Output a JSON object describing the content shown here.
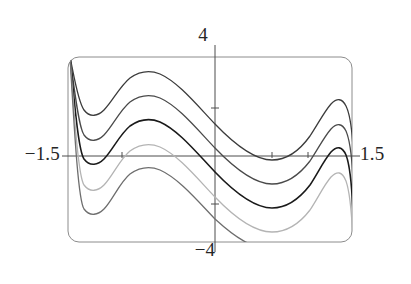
{
  "figure": {
    "title": "",
    "background": "#ffffff",
    "frame": {
      "x": 68,
      "y": 57,
      "width": 284,
      "height": 185,
      "corner_radius": 11,
      "stroke": "#8c8c8c",
      "stroke_width": 1
    },
    "axes": {
      "horizontal": {
        "y": 156,
        "x1": 62,
        "x2": 360,
        "stroke": "#4d4d4d"
      },
      "vertical": {
        "x": 215,
        "y1": 45,
        "y2": 252,
        "stroke": "#4d4d4d"
      },
      "ticks_h": [
        122,
        272,
        308
      ],
      "ticks_v": [
        108,
        204
      ],
      "tick_len": 5
    },
    "labels": {
      "top": "4",
      "bottom": "−4",
      "left": "−1.5",
      "right": "1.5"
    }
  },
  "chart_data": {
    "type": "line",
    "title": "",
    "xlabel": "",
    "ylabel": "",
    "xlim": [
      -1.5,
      1.5
    ],
    "ylim": [
      -4,
      4
    ],
    "xticks": [
      -1.5,
      1.5
    ],
    "yticks": [
      -4,
      4
    ],
    "grid": false,
    "legend": null,
    "series": [
      {
        "name": "curve-1",
        "color": "#3c3c3c",
        "width": 1.3,
        "offset": 2.0,
        "path": "M 70,57 C 74,76 78,102 84,110 C 90,118 98,116 104,110 C 112,102 120,86 130,78 C 140,71 150,70 160,74 C 178,82 196,104 215,124 C 238,148 256,160 272,160 C 288,160 300,150 310,136 C 318,124 324,112 331,104 C 337,98 342,98 346,106 C 350,114 352,130 353,148"
      },
      {
        "name": "curve-2",
        "color": "#4a4a4a",
        "width": 1.3,
        "offset": 1.0,
        "path": "M 70,57 C 74,84 78,126 84,135 C 90,143 98,141 104,135 C 112,127 120,110 130,102 C 140,95 150,94 160,98 C 178,106 196,128 215,148 C 238,172 256,184 272,184 C 288,184 300,174 310,161 C 318,149 324,137 331,129 C 337,123 342,123 346,131 C 350,140 352,158 353,180"
      },
      {
        "name": "curve-3",
        "color": "#1a1a1a",
        "width": 1.6,
        "offset": 0.0,
        "path": "M 70,57 C 74,96 78,150 84,159 C 90,167 98,165 104,159 C 112,151 120,134 130,126 C 140,119 150,118 160,122 C 178,130 196,152 215,172 C 238,196 256,208 272,208 C 288,208 300,198 310,185 C 318,173 324,160 331,152 C 337,146 342,146 346,155 C 350,165 352,188 353,214"
      },
      {
        "name": "curve-4",
        "color": "#b4b4b4",
        "width": 1.3,
        "offset": -1.0,
        "path": "M 70,57 C 74,110 78,176 84,185 C 90,193 98,191 104,185 C 112,177 120,159 130,151 C 140,144 150,143 160,147 C 178,155 196,177 215,197 C 238,221 256,232 272,232 C 288,232 300,223 310,210 C 318,198 324,185 331,177 C 337,171 342,171 346,181 C 350,192 352,218 353,242"
      },
      {
        "name": "curve-5",
        "color": "#6e6e6e",
        "width": 1.3,
        "offset": -2.0,
        "path": "M 70,57 C 74,124 78,200 84,209 C 90,217 98,215 104,209 C 112,201 120,182 130,174 C 140,167 150,166 160,170 C 178,178 196,199 215,219 C 238,240 252,247 264,247"
      }
    ]
  }
}
